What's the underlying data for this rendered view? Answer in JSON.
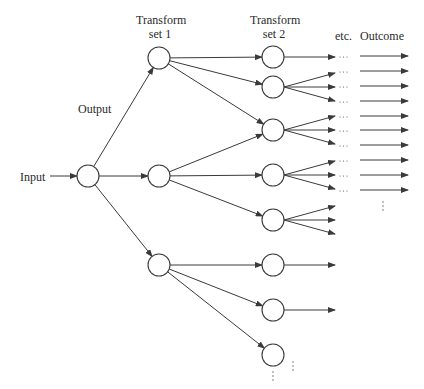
{
  "labels": {
    "input": "Input",
    "output": "Output",
    "transform_set_1": [
      "Transform",
      "set 1"
    ],
    "transform_set_2": [
      "Transform",
      "set 2"
    ],
    "etc": "etc.",
    "outcome": "Outcome"
  },
  "colors": {
    "stroke": "#3a3a3a",
    "background": "#ffffff"
  },
  "diagram": {
    "input_node": {
      "x": 88,
      "y": 176
    },
    "transform_set_1": [
      {
        "x": 159,
        "y": 58
      },
      {
        "x": 159,
        "y": 176
      },
      {
        "x": 159,
        "y": 265
      }
    ],
    "transform_set_2": [
      {
        "x": 273,
        "y": 57,
        "from": 0,
        "fanout": 1
      },
      {
        "x": 273,
        "y": 87,
        "from": 0,
        "fanout": 3
      },
      {
        "x": 273,
        "y": 130,
        "from": [
          0,
          1
        ],
        "fanout": 3
      },
      {
        "x": 273,
        "y": 175,
        "from": 1,
        "fanout": 3
      },
      {
        "x": 273,
        "y": 220,
        "from": 1,
        "fanout": 3
      },
      {
        "x": 273,
        "y": 265,
        "from": 2,
        "fanout": 1
      },
      {
        "x": 273,
        "y": 310,
        "from": 2,
        "fanout": 1
      },
      {
        "x": 273,
        "y": 355,
        "from": 2,
        "fanout": 0
      }
    ],
    "outcome_rows": 10,
    "ellipsis": "..."
  }
}
